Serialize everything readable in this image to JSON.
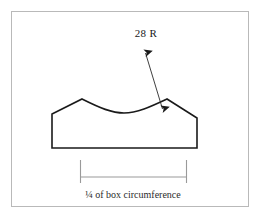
{
  "drawing": {
    "title": "Box end cross-section profile",
    "canvas": {
      "width": 268,
      "height": 221,
      "background": "#ffffff"
    },
    "border": {
      "color": "#b9b9b9",
      "x": 11,
      "y": 11,
      "width": 238,
      "height": 196
    },
    "annotations": {
      "radius_label": "28 R",
      "dimension_caption": "¼ of box circumference"
    },
    "profile": {
      "line_color": "#1a1a1a",
      "baseline_y": 148,
      "left_edge_x": 52,
      "right_edge_x": 197,
      "peak_left": {
        "x": 82,
        "y": 99
      },
      "peak_right": {
        "x": 167,
        "y": 99
      },
      "arc_low_point": {
        "x": 124,
        "y": 113
      }
    },
    "leader": {
      "color": "#2a2a2a",
      "from": {
        "x": 145,
        "y": 52
      },
      "to": {
        "x": 163,
        "y": 110
      },
      "arrowheads": "both"
    },
    "dimension_line": {
      "color": "#9a9a9a",
      "y": 177,
      "left_tick_x": 80,
      "right_tick_x": 186,
      "tick_top_y": 160
    }
  }
}
